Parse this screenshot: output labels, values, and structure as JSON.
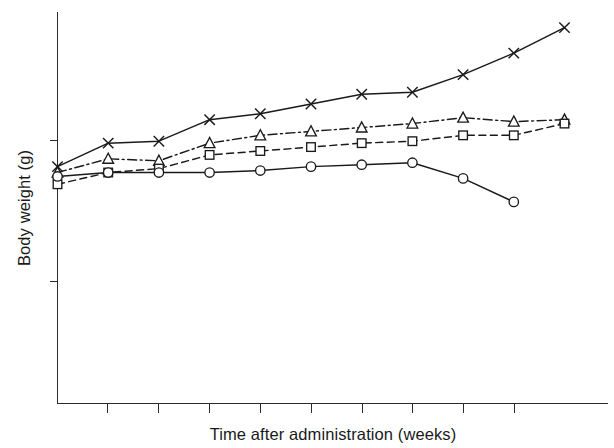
{
  "chart_data": {
    "type": "line",
    "title": "",
    "subtitle": "",
    "xlabel": "Time after administration (weeks)",
    "ylabel": "Body weight (g)",
    "grid": false,
    "legend": "none",
    "x_tick_labels": [
      "",
      "",
      "",
      "",
      "",
      "",
      "",
      "",
      ""
    ],
    "y_tick_labels": [
      "",
      ""
    ],
    "x_axis_range_note": "unlabelled ticks, 9 major ticks along axis",
    "y_axis_range_note": "unlabelled axis with 2 tick marks",
    "x": [
      0,
      1,
      2,
      3,
      4,
      5,
      6,
      7,
      8,
      9,
      10
    ],
    "xlim": [
      0,
      10
    ],
    "ylim": [
      0,
      100
    ],
    "series": [
      {
        "name": "series-cross",
        "marker": "x",
        "linestyle": "solid",
        "values": [
          60.5,
          66.5,
          67.0,
          72.5,
          74.0,
          76.5,
          79.0,
          79.5,
          84.0,
          89.5,
          96.0
        ]
      },
      {
        "name": "series-triangle",
        "marker": "triangle",
        "linestyle": "dash-dot",
        "values": [
          59.0,
          62.5,
          62.0,
          66.5,
          68.5,
          69.5,
          70.5,
          71.5,
          73.0,
          72.0,
          72.5
        ]
      },
      {
        "name": "series-square",
        "marker": "square",
        "linestyle": "dashed",
        "values": [
          56.0,
          59.0,
          60.0,
          63.5,
          64.5,
          65.5,
          66.5,
          67.0,
          68.5,
          68.5,
          71.5
        ]
      },
      {
        "name": "series-circle",
        "marker": "circle",
        "linestyle": "solid",
        "values": [
          58.0,
          59.0,
          59.0,
          59.0,
          59.5,
          60.5,
          61.0,
          61.5,
          57.5,
          51.5,
          null
        ]
      }
    ]
  },
  "axis": {
    "x_label": "Time after administration (weeks)",
    "y_label": "Body weight (g)"
  }
}
